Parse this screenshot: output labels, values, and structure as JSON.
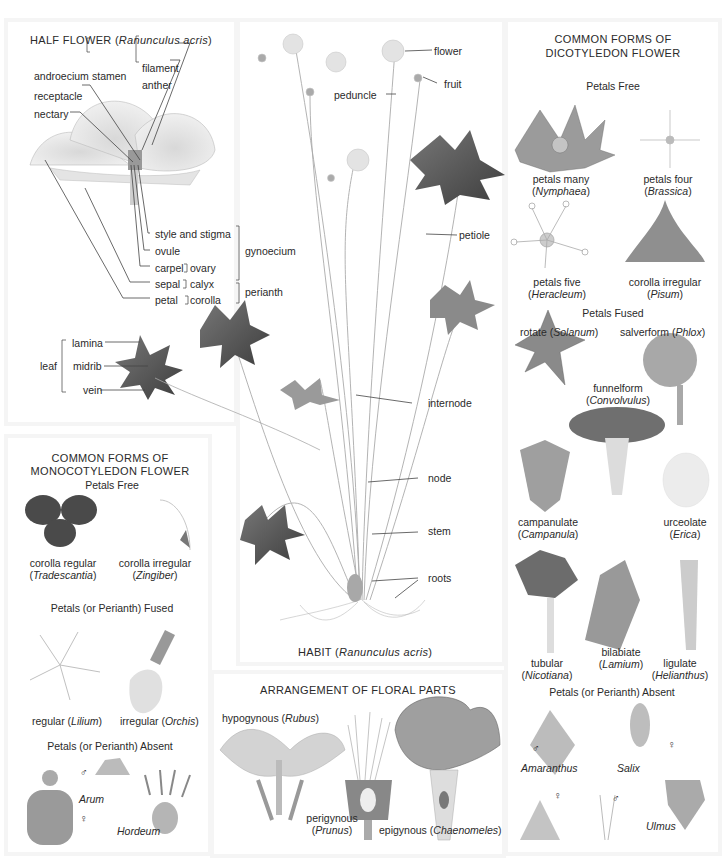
{
  "half_flower": {
    "title_prefix": "HALF FLOWER (",
    "title_species": "Ranunculus acris",
    "title_suffix": ")",
    "labels": {
      "androecium": "androecium",
      "stamen": "stamen",
      "filament": "filament",
      "anther": "anther",
      "receptacle": "receptacle",
      "nectary": "nectary",
      "style_and_stigma": "style and stigma",
      "ovule": "ovule",
      "carpel": "carpel",
      "ovary": "ovary",
      "gynoecium": "gynoecium",
      "sepal": "sepal",
      "calyx": "calyx",
      "petal": "petal",
      "corolla": "corolla",
      "perianth": "perianth"
    }
  },
  "leaf": {
    "group_label": "leaf",
    "parts": [
      "lamina",
      "midrib",
      "vein"
    ]
  },
  "habit": {
    "title_prefix": "HABIT (",
    "title_species": "Ranunculus acris",
    "title_suffix": ")",
    "labels": {
      "flower": "flower",
      "fruit": "fruit",
      "peduncle": "peduncle",
      "petiole": "petiole",
      "internode": "internode",
      "node": "node",
      "stem": "stem",
      "roots": "roots"
    }
  },
  "dicot": {
    "title_line1": "COMMON FORMS OF",
    "title_line2": "DICOTYLEDON FLOWER",
    "sections": {
      "free": "Petals Free",
      "fused": "Petals Fused",
      "absent": "Petals (or Perianth) Absent"
    },
    "free_items": [
      {
        "form": "petals many",
        "genus": "Nymphaea"
      },
      {
        "form": "petals four",
        "genus": "Brassica"
      },
      {
        "form": "petals five",
        "genus": "Heracleum"
      },
      {
        "form": "corolla irregular",
        "genus": "Pisum"
      }
    ],
    "fused_items": [
      {
        "form": "rotate",
        "genus": "Solanum"
      },
      {
        "form": "salverform",
        "genus": "Phlox"
      },
      {
        "form": "funnelform",
        "genus": "Convolvulus"
      },
      {
        "form": "campanulate",
        "genus": "Campanula"
      },
      {
        "form": "urceolate",
        "genus": "Erica"
      },
      {
        "form": "tubular",
        "genus": "Nicotiana"
      },
      {
        "form": "bilabiate",
        "genus": "Lamium"
      },
      {
        "form": "ligulate",
        "genus": "Helianthus"
      }
    ],
    "absent_items": [
      {
        "genus": "Amaranthus",
        "male": "♂",
        "female": "♀"
      },
      {
        "genus": "Salix",
        "male": "♂",
        "female": "♀"
      },
      {
        "genus": "Ulmus"
      }
    ]
  },
  "monocot": {
    "title_line1": "COMMON FORMS OF",
    "title_line2": "MONOCOTYLEDON FLOWER",
    "sections": {
      "free": "Petals Free",
      "fused": "Petals (or Perianth) Fused",
      "absent": "Petals (or Perianth) Absent"
    },
    "free_items": [
      {
        "form": "corolla regular",
        "genus": "Tradescantia"
      },
      {
        "form": "corolla irregular",
        "genus": "Zingiber"
      }
    ],
    "fused_items": [
      {
        "form": "regular",
        "genus": "Lilium"
      },
      {
        "form": "irregular",
        "genus": "Orchis"
      }
    ],
    "absent_items": [
      {
        "genus": "Arum",
        "male": "♂",
        "female": "♀"
      },
      {
        "genus": "Hordeum"
      }
    ]
  },
  "arrangement": {
    "title": "ARRANGEMENT OF FLORAL PARTS",
    "items": [
      {
        "form": "hypogynous",
        "genus": "Rubus"
      },
      {
        "form": "perigynous",
        "genus": "Prunus"
      },
      {
        "form": "epigynous",
        "genus": "Chaenomeles"
      }
    ]
  },
  "colors": {
    "background": "#ffffff",
    "panel_edge": "#f5f5f5",
    "text": "#2a2a2a",
    "leaf_dark": "#5a5a5a",
    "petal_light": "#e6e6e6"
  }
}
